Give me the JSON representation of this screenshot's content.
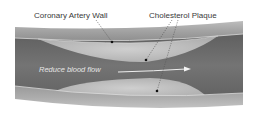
{
  "diagram": {
    "labels": {
      "artery_wall": "Coronary Artery Wall",
      "plaque": "Cholesterol Plaque",
      "flow": "Reduce blood flow"
    },
    "colors": {
      "wall": "#a8a8a8",
      "wall_edge": "#8a8a8a",
      "lumen": "#6e6e6e",
      "plaque": "#bdbdbd",
      "plaque_highlight": "#d4d4d4",
      "leader": "#555555",
      "arrow": "#eeeeee"
    }
  }
}
